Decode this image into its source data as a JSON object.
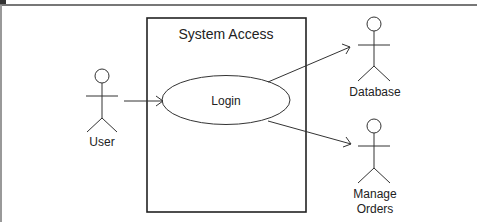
{
  "diagram": {
    "type": "uml-use-case",
    "system": {
      "title": "System Access"
    },
    "use_cases": [
      {
        "id": "login",
        "label": "Login"
      }
    ],
    "actors": [
      {
        "id": "user",
        "label": "User"
      },
      {
        "id": "database",
        "label": "Database"
      },
      {
        "id": "manage_orders",
        "label_line1": "Manage",
        "label_line2": "Orders"
      }
    ],
    "relations": [
      {
        "from": "User",
        "to": "Login",
        "style": "open-arrow"
      },
      {
        "from": "Login",
        "to": "Database",
        "style": "open-arrow"
      },
      {
        "from": "Login",
        "to": "Manage Orders",
        "style": "open-arrow"
      }
    ],
    "colors": {
      "stroke": "#222222",
      "frame": "#888888",
      "background": "#ffffff"
    }
  }
}
